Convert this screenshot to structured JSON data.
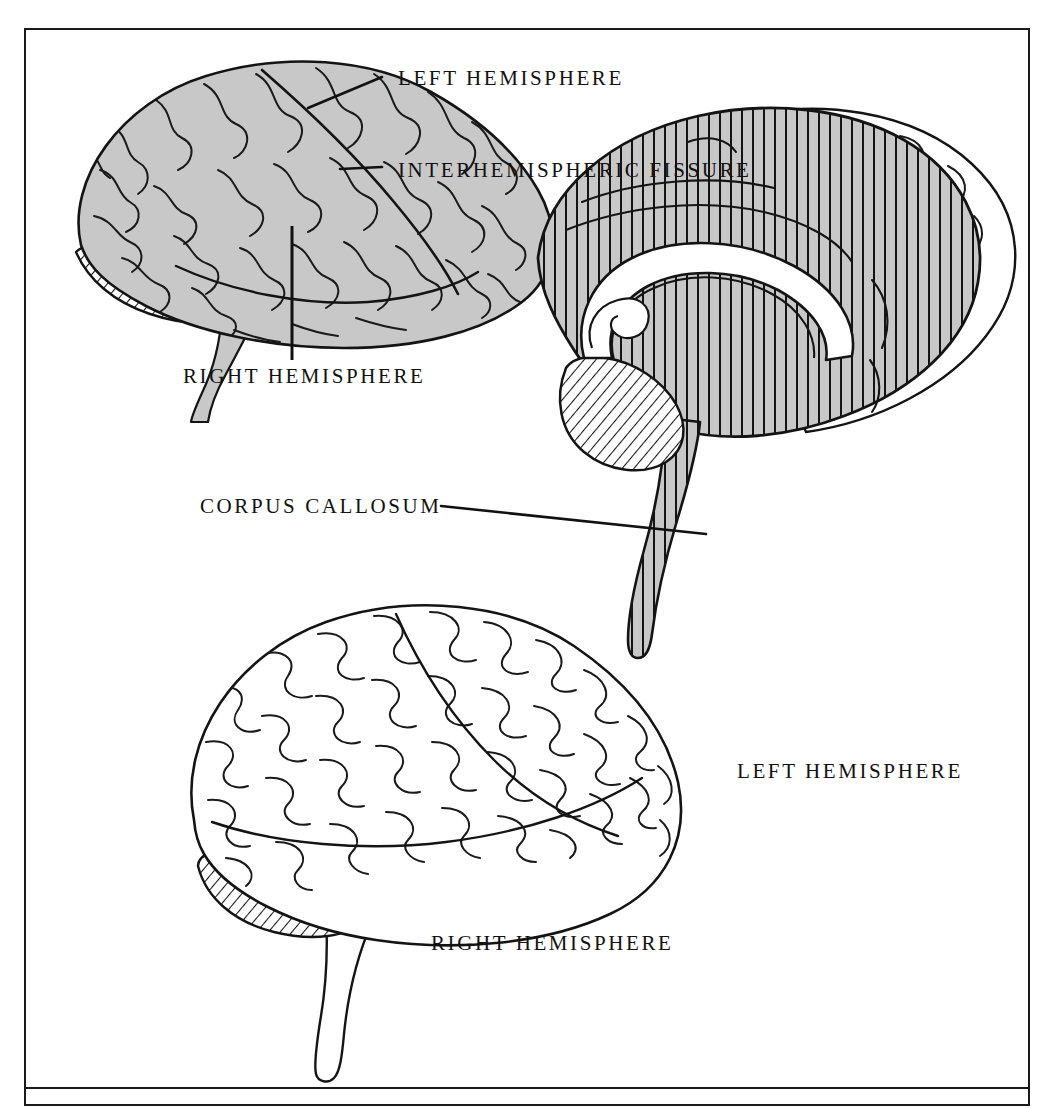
{
  "figure": {
    "frame_color": "#1a1a1a",
    "background_color": "#ffffff",
    "shade_gray": "#c8c8c8",
    "ink_color": "#111111"
  },
  "labels": {
    "left_hemisphere_top": "LEFT HEMISPHERE",
    "interhemispheric_fissure": "INTERHEMISPHERIC FISSURE",
    "right_hemisphere_top": "RIGHT HEMISPHERE",
    "corpus_callosum": "CORPUS CALLOSUM",
    "left_hemisphere_sagittal": "LEFT HEMISPHERE",
    "right_hemisphere_bottom": "RIGHT HEMISPHERE"
  },
  "caption": {
    "text": ""
  },
  "illustrations": {
    "top_brain": {
      "name": "superior-lateral-view",
      "fill": "shaded gray",
      "cerebellum_fill": "diagonal hatch",
      "brainstem_fill": "shaded gray"
    },
    "sagittal_brain": {
      "name": "mid-sagittal-view",
      "cut_surface_fill": "gray with vertical line hatch",
      "corpus_callosum_fill": "white",
      "cerebellum_fill": "diagonal hatch",
      "far_hemisphere_fill": "white outline"
    },
    "bottom_brain": {
      "name": "lateral-view",
      "fill": "white outline",
      "cerebellum_fill": "diagonal hatch"
    }
  }
}
